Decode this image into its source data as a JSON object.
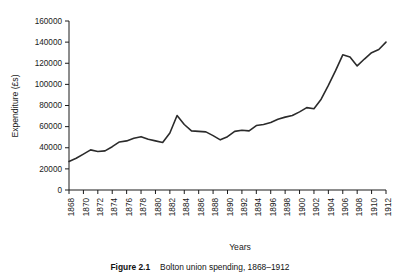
{
  "figure": {
    "caption_label": "Figure 2.1",
    "caption_text": "Bolton union spending, 1868–1912"
  },
  "chart_data": {
    "type": "line",
    "title": "",
    "xlabel": "Years",
    "ylabel": "Expenditure (£s)",
    "xlim": [
      1868,
      1912
    ],
    "ylim": [
      0,
      160000
    ],
    "grid": false,
    "legend": null,
    "line_color": "#2b2b2b",
    "ytick_labels": [
      "0",
      "20000",
      "40000",
      "60000",
      "80000",
      "100000",
      "120000",
      "140000",
      "160000"
    ],
    "yticks": [
      0,
      20000,
      40000,
      60000,
      80000,
      100000,
      120000,
      140000,
      160000
    ],
    "xtick_labels": [
      "1868",
      "1870",
      "1872",
      "1874",
      "1876",
      "1878",
      "1880",
      "1882",
      "1884",
      "1886",
      "1888",
      "1890",
      "1892",
      "1894",
      "1896",
      "1898",
      "1900",
      "1902",
      "1904",
      "1906",
      "1908",
      "1910",
      "1912"
    ],
    "xticks": [
      1868,
      1870,
      1872,
      1874,
      1876,
      1878,
      1880,
      1882,
      1884,
      1886,
      1888,
      1890,
      1892,
      1894,
      1896,
      1898,
      1900,
      1902,
      1904,
      1906,
      1908,
      1910,
      1912
    ],
    "x": [
      1868,
      1869,
      1870,
      1871,
      1872,
      1873,
      1874,
      1875,
      1876,
      1877,
      1878,
      1879,
      1880,
      1881,
      1882,
      1883,
      1884,
      1885,
      1886,
      1887,
      1888,
      1889,
      1890,
      1891,
      1892,
      1893,
      1894,
      1895,
      1896,
      1897,
      1898,
      1899,
      1900,
      1901,
      1902,
      1903,
      1904,
      1905,
      1906,
      1907,
      1908,
      1909,
      1910,
      1911,
      1912
    ],
    "values": [
      27000,
      30000,
      34000,
      38000,
      36500,
      37000,
      41000,
      45500,
      46500,
      49000,
      50500,
      48000,
      46500,
      45000,
      54000,
      70500,
      62000,
      56000,
      55500,
      55000,
      51500,
      47500,
      50500,
      55500,
      56500,
      56000,
      61000,
      62000,
      64000,
      67000,
      69000,
      70500,
      74000,
      78000,
      77000,
      86000,
      99000,
      113000,
      128000,
      126000,
      117500,
      124000,
      130000,
      133000,
      140000
    ]
  }
}
